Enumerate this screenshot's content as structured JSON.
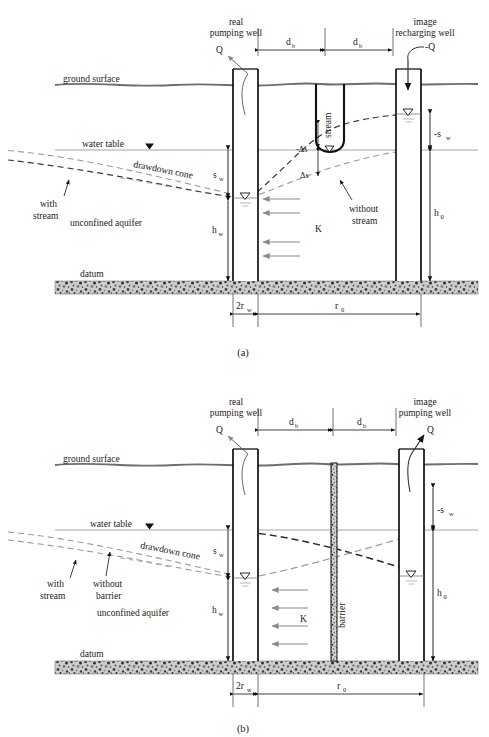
{
  "figure": {
    "panels": [
      {
        "id": "a",
        "caption": "(a)",
        "title_left": "real",
        "title_left2": "pumping well",
        "title_right": "image",
        "title_right2": "recharging well",
        "discharge_real": "Q",
        "discharge_image": "-Q",
        "labels": {
          "ground_surface": "ground surface",
          "water_table": "water table",
          "drawdown_cone": "drawdown cone",
          "unconfined_aquifer": "unconfined aquifer",
          "datum": "datum",
          "with_stream": "with",
          "with_stream2": "stream",
          "without_stream": "without",
          "without_stream2": "stream",
          "stream": "stream",
          "conductivity": "K",
          "delta_s_neg": "-Δs",
          "delta_s_pos": "Δs"
        },
        "dimensions": {
          "db_left": "d",
          "db_left_sub": "b",
          "db_right": "d",
          "db_right_sub": "b",
          "sw": "s",
          "sw_sub": "w",
          "hw": "h",
          "hw_sub": "w",
          "neg_sw": "-s",
          "neg_sw_sub": "w",
          "h0": "h",
          "h0_sub": "0",
          "two_rw": "2r",
          "two_rw_sub": "w",
          "r0": "r",
          "r0_sub": "0"
        }
      },
      {
        "id": "b",
        "caption": "(b)",
        "title_left": "real",
        "title_left2": "pumping well",
        "title_right": "image",
        "title_right2": "pumping well",
        "discharge_real": "Q",
        "discharge_image": "Q",
        "labels": {
          "ground_surface": "ground surface",
          "water_table": "water table",
          "drawdown_cone": "drawdown cone",
          "unconfined_aquifer": "unconfined aquifer",
          "datum": "datum",
          "with_stream": "with",
          "with_stream2": "stream",
          "without_barrier": "without",
          "without_barrier2": "barrier",
          "barrier": "barrier",
          "conductivity": "K"
        },
        "dimensions": {
          "db_left": "d",
          "db_left_sub": "b",
          "db_right": "d",
          "db_right_sub": "b",
          "sw": "s",
          "sw_sub": "w",
          "hw": "h",
          "hw_sub": "w",
          "neg_sw": "-s",
          "neg_sw_sub": "w",
          "h0": "h",
          "h0_sub": "0",
          "two_rw": "2r",
          "two_rw_sub": "w",
          "r0": "r",
          "r0_sub": "0"
        }
      }
    ],
    "colors": {
      "ground_line": "#6e6e6e",
      "water_table_line": "#8c8c8c",
      "casing": "#000000",
      "dashed_curve": "#3a3a3a",
      "dashed_curve_light": "#9a9a9a",
      "arrow_gray": "#8a8a8a",
      "datum_fill": "#c9c9c9",
      "text": "#222222"
    }
  }
}
